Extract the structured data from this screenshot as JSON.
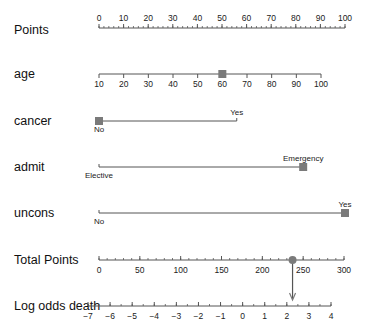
{
  "chart_data": {
    "type": "nomogram",
    "title": "",
    "rows": [
      {
        "label": "Points",
        "kind": "scale",
        "min": 0,
        "max": 100,
        "ticks": [
          0,
          10,
          20,
          30,
          40,
          50,
          60,
          70,
          80,
          90,
          100
        ],
        "minor_step": 2
      },
      {
        "label": "age",
        "kind": "continuous",
        "min": 10,
        "max": 100,
        "ticks": [
          10,
          20,
          30,
          40,
          50,
          60,
          70,
          80,
          90,
          100
        ],
        "marker_value": 60
      },
      {
        "label": "cancer",
        "kind": "categorical",
        "levels": [
          {
            "name": "No",
            "points": 0
          },
          {
            "name": "Yes",
            "points": 56
          }
        ],
        "selected": "No"
      },
      {
        "label": "admit",
        "kind": "categorical",
        "levels": [
          {
            "name": "Elective",
            "points": 0
          },
          {
            "name": "Emergency",
            "points": 83
          }
        ],
        "selected": "Emergency"
      },
      {
        "label": "uncons",
        "kind": "categorical",
        "levels": [
          {
            "name": "No",
            "points": 0
          },
          {
            "name": "Yes",
            "points": 100
          }
        ],
        "selected": "Yes"
      },
      {
        "label": "Total Points",
        "kind": "scale",
        "min": 0,
        "max": 300,
        "ticks": [
          0,
          50,
          100,
          150,
          200,
          250,
          300
        ],
        "minor_step": 10,
        "marker_value": 237
      },
      {
        "label": "Log odds death",
        "kind": "scale",
        "min": -7,
        "max": 4,
        "ticks": [
          -7,
          -6,
          -5,
          -4,
          -3,
          -2,
          -1,
          0,
          1,
          2,
          3,
          4
        ],
        "minor_step": 0.5,
        "marker_value": 2.25
      }
    ],
    "marker_color": "#7a7a7a",
    "line_color": "#555555"
  }
}
